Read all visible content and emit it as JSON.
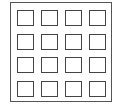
{
  "diagram": {
    "type": "grid-of-squares",
    "rows": 4,
    "columns": 4,
    "cell_count": 16,
    "stroke_color": "#444444",
    "frame_color": "#555555",
    "background_color": "#ffffff",
    "cells": [
      {
        "row": 1,
        "col": 1
      },
      {
        "row": 1,
        "col": 2
      },
      {
        "row": 1,
        "col": 3
      },
      {
        "row": 1,
        "col": 4
      },
      {
        "row": 2,
        "col": 1
      },
      {
        "row": 2,
        "col": 2
      },
      {
        "row": 2,
        "col": 3
      },
      {
        "row": 2,
        "col": 4
      },
      {
        "row": 3,
        "col": 1
      },
      {
        "row": 3,
        "col": 2
      },
      {
        "row": 3,
        "col": 3
      },
      {
        "row": 3,
        "col": 4
      },
      {
        "row": 4,
        "col": 1
      },
      {
        "row": 4,
        "col": 2
      },
      {
        "row": 4,
        "col": 3
      },
      {
        "row": 4,
        "col": 4
      }
    ]
  }
}
